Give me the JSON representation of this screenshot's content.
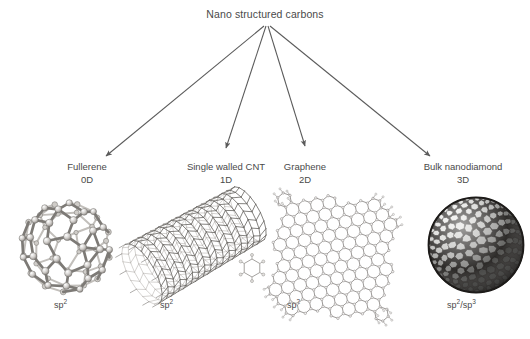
{
  "figure": {
    "title": "Nano structured carbons",
    "background_color": "#ffffff",
    "ink_color": "#4a4a4a"
  },
  "categories": [
    {
      "id": "fullerene",
      "name": "Fullerene",
      "dimensionality": "0D",
      "hybridization": "sp",
      "hybridization_sup": "2",
      "hybridization_full": "sp2",
      "structure_icon": "buckyball-sphere-icon"
    },
    {
      "id": "single-walled-cnt",
      "name": "Single walled CNT",
      "dimensionality": "1D",
      "hybridization": "sp",
      "hybridization_sup": "2",
      "hybridization_full": "sp2",
      "structure_icon": "nanotube-icon"
    },
    {
      "id": "graphene",
      "name": "Graphene",
      "dimensionality": "2D",
      "hybridization": "sp",
      "hybridization_sup": "2",
      "hybridization_full": "sp2",
      "structure_icon": "honeycomb-sheet-icon"
    },
    {
      "id": "bulk-nanodiamond",
      "name": "Bulk nanodiamond",
      "dimensionality": "3D",
      "hybridization": "sp",
      "hybridization_sup": "2",
      "hybridization_full": "sp2/sp3",
      "hybridization_second": "sp",
      "hybridization_second_sup": "3",
      "structure_icon": "nanodiamond-sphere-icon"
    }
  ],
  "arrows": {
    "count": 4,
    "origin_label": "Nano structured carbons",
    "targets": [
      "Fullerene",
      "Single walled CNT",
      "Graphene",
      "Bulk nanodiamond"
    ]
  }
}
